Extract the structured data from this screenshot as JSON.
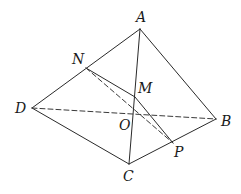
{
  "figure": {
    "type": "geometry-diagram",
    "colors": {
      "line": "#2a2a2a",
      "dashed": "#3a3a3a",
      "label": "#1a1a1a",
      "background": "#ffffff"
    },
    "points": [
      {
        "id": "A",
        "label": "A",
        "x": 140,
        "y": 29,
        "lx": 136,
        "ly": 22
      },
      {
        "id": "N",
        "label": "N",
        "x": 86,
        "y": 68,
        "lx": 72,
        "ly": 64
      },
      {
        "id": "M",
        "label": "M",
        "x": 135,
        "y": 97,
        "lx": 138,
        "ly": 93
      },
      {
        "id": "D",
        "label": "D",
        "x": 32,
        "y": 108,
        "lx": 15,
        "ly": 113
      },
      {
        "id": "O",
        "label": "O",
        "x": 131,
        "y": 115,
        "lx": 119,
        "ly": 130
      },
      {
        "id": "B",
        "label": "B",
        "x": 216,
        "y": 119,
        "lx": 221,
        "ly": 126
      },
      {
        "id": "P",
        "label": "P",
        "x": 173,
        "y": 143,
        "lx": 174,
        "ly": 157
      },
      {
        "id": "C",
        "label": "C",
        "x": 129,
        "y": 164,
        "lx": 123,
        "ly": 181
      }
    ],
    "edges": [
      {
        "from": "A",
        "to": "D",
        "style": "solid"
      },
      {
        "from": "A",
        "to": "B",
        "style": "solid"
      },
      {
        "from": "A",
        "to": "C",
        "style": "solid"
      },
      {
        "from": "D",
        "to": "C",
        "style": "solid"
      },
      {
        "from": "C",
        "to": "B",
        "style": "solid"
      },
      {
        "from": "N",
        "to": "M",
        "style": "solid"
      },
      {
        "from": "M",
        "to": "P",
        "style": "solid"
      },
      {
        "from": "D",
        "to": "B",
        "style": "dashed"
      },
      {
        "from": "N",
        "to": "P",
        "style": "dashed"
      }
    ]
  }
}
